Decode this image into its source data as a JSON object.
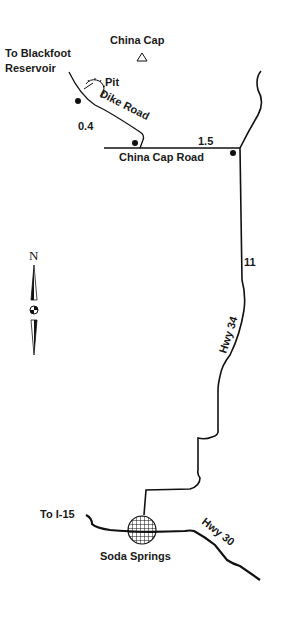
{
  "map": {
    "landmarks": {
      "china_cap": "China Cap",
      "blackfoot_line1": "To Blackfoot",
      "blackfoot_line2": "Reservoir",
      "pit": "Pit",
      "soda_springs": "Soda Springs",
      "to_i15": "To I-15"
    },
    "roads": {
      "dike_road": "Dike Road",
      "china_cap_road": "China Cap Road",
      "hwy34": "Hwy 34",
      "hwy30": "Hwy 30"
    },
    "distances": {
      "dike": "0.4",
      "china_cap_road": "1.5",
      "hwy34": "11"
    },
    "compass": {
      "north": "N"
    },
    "colors": {
      "ink": "#111111",
      "background": "#ffffff"
    }
  }
}
